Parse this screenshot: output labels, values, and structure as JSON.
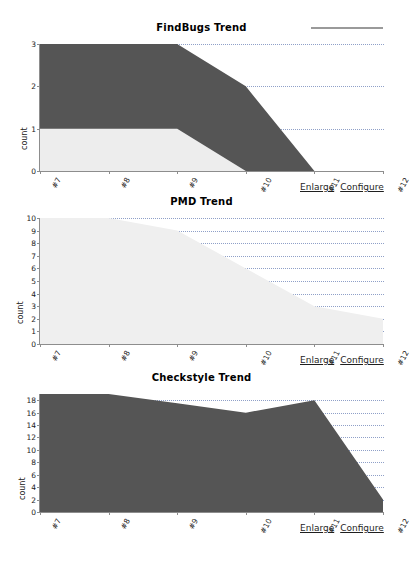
{
  "page": {
    "background": "#ffffff",
    "colors": {
      "dark_series": "#555555",
      "light_series": "#ededed",
      "pmd_series": "#efefef",
      "axis": "#8d8d8d",
      "gridline": "#8fa0c8",
      "link": "#1f1f1f",
      "rule": "#9a9a9a"
    }
  },
  "top_rule": {
    "name": "horizontal-rule"
  },
  "actions": {
    "enlarge_label": "Enlarge",
    "configure_label": "Configure"
  },
  "charts": [
    {
      "id": "findbugs",
      "title": "FindBugs Trend",
      "ylabel": "count",
      "chart_data": {
        "type": "area",
        "title": "FindBugs Trend",
        "xlabel": "",
        "ylabel": "count",
        "stacked": true,
        "grid": true,
        "legend": "none",
        "categories": [
          "#7",
          "#8",
          "#9",
          "#10",
          "#11",
          "#12"
        ],
        "xticklabels": [
          "#7",
          "#8",
          "#9",
          "#10",
          "#11",
          "#12"
        ],
        "yticklabels": [
          "0",
          "1",
          "2",
          "3"
        ],
        "ylim": [
          0,
          3
        ],
        "yticks": [
          0,
          1,
          2,
          3
        ],
        "series": [
          {
            "name": "low",
            "color": "#ededed",
            "values": [
              1,
              1,
              1,
              0,
              0,
              0
            ]
          },
          {
            "name": "high",
            "color": "#555555",
            "values": [
              2,
              2,
              2,
              2,
              0,
              0
            ]
          }
        ],
        "totals": [
          3,
          3,
          3,
          2,
          0,
          0
        ]
      }
    },
    {
      "id": "pmd",
      "title": "PMD Trend",
      "ylabel": "count",
      "chart_data": {
        "type": "area",
        "title": "PMD Trend",
        "xlabel": "",
        "ylabel": "count",
        "stacked": true,
        "grid": true,
        "legend": "none",
        "categories": [
          "#7",
          "#8",
          "#9",
          "#10",
          "#11",
          "#12"
        ],
        "xticklabels": [
          "#7",
          "#8",
          "#9",
          "#10",
          "#11",
          "#12"
        ],
        "yticklabels": [
          "0",
          "1",
          "2",
          "3",
          "4",
          "5",
          "6",
          "7",
          "8",
          "9",
          "10"
        ],
        "ylim": [
          0,
          10
        ],
        "yticks": [
          0,
          1,
          2,
          3,
          4,
          5,
          6,
          7,
          8,
          9,
          10
        ],
        "series": [
          {
            "name": "low",
            "color": "#efefef",
            "values": [
              10,
              10,
              9,
              6,
              3,
              2
            ]
          }
        ],
        "totals": [
          10,
          10,
          9,
          6,
          3,
          2
        ]
      }
    },
    {
      "id": "checkstyle",
      "title": "Checkstyle Trend",
      "ylabel": "count",
      "chart_data": {
        "type": "area",
        "title": "Checkstyle Trend",
        "xlabel": "",
        "ylabel": "count",
        "stacked": true,
        "grid": true,
        "legend": "none",
        "categories": [
          "#7",
          "#8",
          "#9",
          "#10",
          "#11",
          "#12"
        ],
        "xticklabels": [
          "#7",
          "#8",
          "#9",
          "#10",
          "#11",
          "#12"
        ],
        "yticklabels": [
          "0",
          "2",
          "4",
          "6",
          "8",
          "10",
          "12",
          "14",
          "16",
          "18"
        ],
        "ylim": [
          0,
          19
        ],
        "yticks": [
          0,
          2,
          4,
          6,
          8,
          10,
          12,
          14,
          16,
          18
        ],
        "series": [
          {
            "name": "high",
            "color": "#555555",
            "values": [
              19,
              19,
              17.5,
              16,
              18,
              2
            ]
          }
        ],
        "totals": [
          19,
          19,
          17.5,
          16,
          18,
          2
        ]
      }
    }
  ]
}
